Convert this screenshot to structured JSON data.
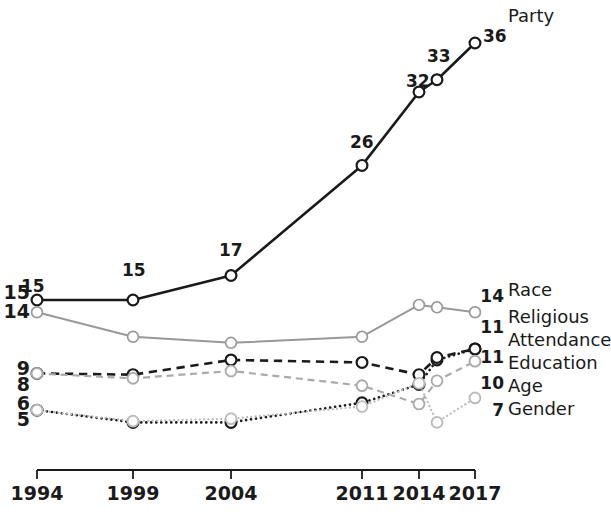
{
  "chart_data": {
    "type": "line",
    "title": "",
    "subtitle": "",
    "xlabel": "",
    "ylabel": "",
    "grid": false,
    "legend_position": "right-inline-labels",
    "x": [
      1994,
      1999,
      2004,
      2011,
      2014,
      2015,
      2017
    ],
    "tick_labels": [
      "1994",
      "1999",
      "2004",
      "2011",
      "2014",
      "2017"
    ],
    "tick_values": [
      1994,
      1999,
      2004,
      2011,
      2014,
      2017
    ],
    "ylim": [
      4,
      38
    ],
    "series": [
      {
        "name": "Party",
        "style": "solid",
        "color": "#1a1a1a",
        "width": 2.6,
        "x": [
          1994,
          1999,
          2004,
          2011,
          2014,
          2015,
          2017
        ],
        "values": [
          15,
          15,
          17,
          26,
          32,
          33,
          36
        ],
        "point_labels": [
          "15",
          "15",
          "17",
          "26",
          "32",
          "33",
          "36"
        ],
        "start_label": "15",
        "end_label": "36"
      },
      {
        "name": "Race",
        "style": "solid",
        "color": "#999999",
        "width": 2.0,
        "x": [
          1994,
          1999,
          2004,
          2011,
          2014,
          2015,
          2017
        ],
        "values": [
          14,
          12,
          11.5,
          12,
          14.6,
          14.4,
          14
        ],
        "start_label": "14",
        "end_label": "14"
      },
      {
        "name": "Religious Attendance",
        "style": "dotted",
        "color": "#1a1a1a",
        "width": 2.6,
        "x": [
          1994,
          1999,
          2004,
          2011,
          2014,
          2015,
          2017
        ],
        "values": [
          6,
          5,
          5,
          6.6,
          8.1,
          10.1,
          11
        ],
        "start_label": "6",
        "end_label": "11"
      },
      {
        "name": "Education",
        "style": "dashed",
        "color": "#1a1a1a",
        "width": 2.6,
        "x": [
          1994,
          1999,
          2004,
          2011,
          2014,
          2015,
          2017
        ],
        "values": [
          9,
          8.9,
          10.1,
          9.9,
          8.9,
          10.3,
          11
        ],
        "start_label": "9",
        "end_label": "11"
      },
      {
        "name": "Age",
        "style": "dashed",
        "color": "#aaaaaa",
        "width": 2.2,
        "x": [
          1994,
          1999,
          2004,
          2011,
          2014,
          2015,
          2017
        ],
        "values": [
          9,
          8.6,
          9.2,
          8.0,
          6.5,
          8.4,
          10
        ],
        "start_label": "8",
        "end_label": "10"
      },
      {
        "name": "Gender",
        "style": "dotted",
        "color": "#bbbbbb",
        "width": 2.2,
        "x": [
          1994,
          1999,
          2004,
          2011,
          2014,
          2015,
          2017
        ],
        "values": [
          6,
          5.1,
          5.3,
          6.3,
          8.2,
          5.0,
          7
        ],
        "start_label": "5",
        "end_label": "7"
      }
    ]
  },
  "value_labels": {
    "party": {
      "p1994": "15",
      "p1999": "15",
      "p2004": "17",
      "p2011": "26",
      "p2014": "32",
      "p2015": "33",
      "p2017": "36"
    }
  },
  "left_axis_labels": [
    {
      "text": "15"
    },
    {
      "text": "14"
    },
    {
      "text": "9"
    },
    {
      "text": "8"
    },
    {
      "text": "6"
    },
    {
      "text": "5"
    }
  ],
  "right_labels": [
    {
      "value": "14",
      "name": "Race"
    },
    {
      "value": "11",
      "name": "Religious"
    },
    {
      "value": "",
      "name": "Attendance"
    },
    {
      "value": "11",
      "name": "Education"
    },
    {
      "value": "10",
      "name": "Age"
    },
    {
      "value": "7",
      "name": "Gender"
    }
  ],
  "top_label": {
    "name": "Party"
  },
  "x_axis": {
    "ticks": [
      "1994",
      "1999",
      "2004",
      "2011",
      "2014",
      "2017"
    ]
  }
}
